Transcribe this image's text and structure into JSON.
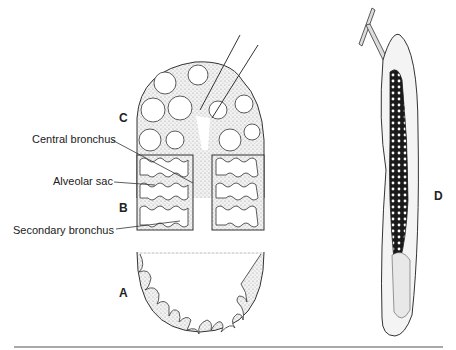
{
  "diagram": {
    "panels": [
      {
        "id": "A",
        "label": "A",
        "x": 119,
        "y": 287
      },
      {
        "id": "B",
        "label": "B",
        "x": 119,
        "y": 202
      },
      {
        "id": "C",
        "label": "C",
        "x": 119,
        "y": 112
      },
      {
        "id": "D",
        "label": "D",
        "x": 434,
        "y": 190
      }
    ],
    "annotations": [
      {
        "text": "Central bronchus",
        "x": 32,
        "y": 134
      },
      {
        "text": "Alveolar sac",
        "x": 53,
        "y": 176
      },
      {
        "text": "Secondary bronchus",
        "x": 13,
        "y": 225
      }
    ],
    "colors": {
      "line": "#333333",
      "fill_stipple": "#d8d8d8",
      "dark_tissue": "#1a1a1a"
    }
  }
}
